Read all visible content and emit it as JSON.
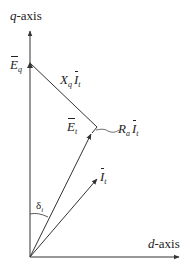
{
  "diagram": {
    "axes": {
      "q_axis": {
        "var": "q",
        "suffix": "-axis"
      },
      "d_axis": {
        "var": "d",
        "suffix": "-axis"
      }
    },
    "labels": {
      "Eq": {
        "base": "E",
        "sub": "q"
      },
      "XqIt": {
        "coef": "X",
        "coef_sub": "q",
        "base": "I",
        "sub": "t"
      },
      "Et": {
        "base": "E",
        "sub": "t"
      },
      "RaIt": {
        "coef": "R",
        "coef_sub": "a",
        "base": "I",
        "sub": "t"
      },
      "It": {
        "base": "I",
        "sub": "t"
      },
      "delta": {
        "base": "δ",
        "sub": "i"
      }
    },
    "geometry": {
      "origin": [
        30,
        257
      ],
      "q_axis_tip": [
        30,
        30
      ],
      "d_axis_tip": [
        180,
        257
      ],
      "Eq_point": [
        30,
        63
      ],
      "corner_point": [
        97,
        127
      ],
      "Et_tip": [
        92,
        133
      ],
      "It_tip": [
        98,
        178
      ]
    },
    "colors": {
      "line": "#333333",
      "text": "#222222"
    }
  }
}
